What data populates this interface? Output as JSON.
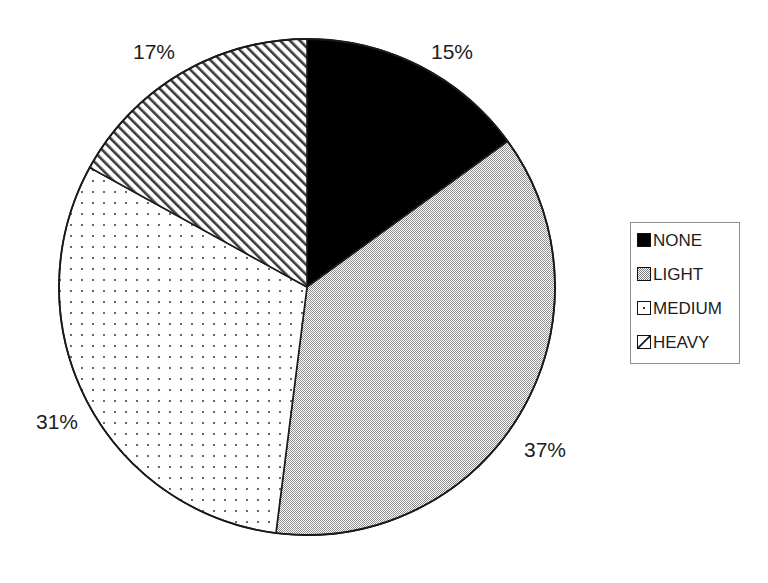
{
  "chart_data": {
    "type": "pie",
    "title": "",
    "labels": [
      "NONE",
      "LIGHT",
      "MEDIUM",
      "HEAVY"
    ],
    "values": [
      15,
      37,
      31,
      17
    ],
    "value_labels": [
      "15%",
      "37%",
      "31%",
      "17%"
    ],
    "start_angle_deg": 0,
    "direction": "clockwise",
    "legend_position": "right",
    "grid": false,
    "xlabel": "",
    "ylabel": "",
    "fills": [
      {
        "name": "NONE",
        "style": "solid",
        "color": "#000000"
      },
      {
        "name": "LIGHT",
        "style": "dither-50",
        "color": "#b2b2b2"
      },
      {
        "name": "MEDIUM",
        "style": "dots",
        "color": "#ffffff"
      },
      {
        "name": "HEAVY",
        "style": "diagonal-hatch",
        "color": "#ffffff"
      }
    ],
    "outline_color": "#1a1a1a",
    "center": {
      "x": 307,
      "y": 287
    },
    "radius": 248
  },
  "labels": {
    "none_pct": "15%",
    "light_pct": "37%",
    "medium_pct": "31%",
    "heavy_pct": "17%"
  },
  "legend": {
    "items": [
      {
        "label": "NONE"
      },
      {
        "label": "LIGHT"
      },
      {
        "label": "MEDIUM"
      },
      {
        "label": "HEAVY"
      }
    ]
  }
}
